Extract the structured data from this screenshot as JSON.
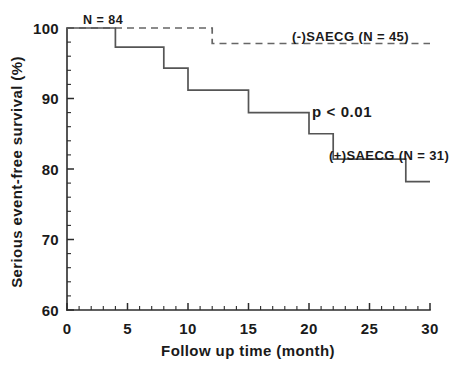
{
  "chart_data": {
    "type": "line",
    "subtype": "kaplan-meier-step",
    "title": "",
    "xlabel": "Follow up time (month)",
    "ylabel": "Serious event-free survival (%)",
    "xlim": [
      0,
      30
    ],
    "ylim": [
      60,
      100
    ],
    "x_ticks": [
      0,
      5,
      10,
      15,
      20,
      25,
      30
    ],
    "x_tick_labels": [
      "0",
      "5",
      "10",
      "15",
      "20",
      "25",
      "30"
    ],
    "x_minor_step": 1,
    "y_ticks": [
      60,
      70,
      80,
      90,
      100
    ],
    "y_tick_labels": [
      "60",
      "70",
      "80",
      "90",
      "100"
    ],
    "y_minor_step": 2,
    "grid": false,
    "legend_position": "inline-annotations",
    "series": [
      {
        "name": "(-)SAECG (N = 45)",
        "style": "dashed",
        "color": "#666666",
        "label": "(-)SAECG (N = 45)",
        "x": [
          0,
          12,
          12,
          30
        ],
        "y": [
          100,
          100,
          97.8,
          97.8
        ],
        "steps": [
          {
            "time": 0,
            "survival": 100
          },
          {
            "time": 12,
            "survival": 97.8
          },
          {
            "time": 30,
            "survival": 97.8
          }
        ]
      },
      {
        "name": "(+)SAECG (N = 31)",
        "style": "solid",
        "color": "#555555",
        "label": "(+)SAECG (N = 31)",
        "x": [
          0,
          4,
          4,
          8,
          8,
          10,
          10,
          15,
          15,
          20,
          20,
          22,
          22,
          28,
          28,
          30
        ],
        "y": [
          100,
          100,
          97.3,
          97.3,
          94.3,
          94.3,
          91.2,
          91.2,
          88.0,
          88.0,
          85.0,
          85.0,
          81.4,
          81.4,
          78.2,
          78.2
        ],
        "steps": [
          {
            "time": 0,
            "survival": 100
          },
          {
            "time": 4,
            "survival": 97.3
          },
          {
            "time": 8,
            "survival": 94.3
          },
          {
            "time": 10,
            "survival": 91.2
          },
          {
            "time": 15,
            "survival": 88.0
          },
          {
            "time": 20,
            "survival": 85.0
          },
          {
            "time": 22,
            "survival": 81.4
          },
          {
            "time": 28,
            "survival": 78.2
          },
          {
            "time": 30,
            "survival": 78.2
          }
        ]
      }
    ],
    "annotations": [
      {
        "id": "total-n",
        "text": "N = 84",
        "x": 1.2,
        "y": 101.8
      },
      {
        "id": "p-value",
        "text": "p < 0.01",
        "x": 20.0,
        "y": 91.5
      },
      {
        "id": "label-neg",
        "text": "(-)SAECG (N = 45)",
        "x": 18.5,
        "y": 99.2
      },
      {
        "id": "label-pos",
        "text": "(+)SAECG (N = 31)",
        "x": 21.8,
        "y": 83.6
      }
    ]
  },
  "labels": {
    "total_n": "N = 84",
    "p_value": "p < 0.01",
    "series_neg": "(-)SAECG (N = 45)",
    "series_pos": "(+)SAECG (N = 31)",
    "x_axis_title": "Follow up time (month)",
    "y_axis_title": "Serious event-free survival (%)"
  },
  "x_tick_labels": [
    "0",
    "5",
    "10",
    "15",
    "20",
    "25",
    "30"
  ],
  "y_tick_labels": [
    "60",
    "70",
    "80",
    "90",
    "100"
  ],
  "colors": {
    "axis": "#2b2b2b",
    "text": "#1a1a1a",
    "solid_series": "#555555",
    "dashed_series": "#666666",
    "background": "#ffffff"
  }
}
